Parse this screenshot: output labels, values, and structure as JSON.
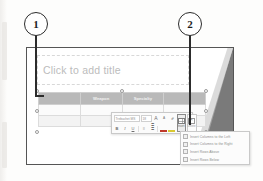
{
  "callouts": [
    {
      "number": "1"
    },
    {
      "number": "2"
    }
  ],
  "slide": {
    "title_placeholder": "Click to add title",
    "table": {
      "headers": [
        "",
        "Weapon",
        "Specialty",
        ""
      ],
      "rows": [
        [
          "",
          "",
          "",
          ""
        ],
        [
          "",
          "",
          "",
          ""
        ]
      ]
    }
  },
  "mini_toolbar": {
    "font_name": "Trebuchet MS",
    "font_size": "18",
    "grow_font_label": "A",
    "shrink_font_label": "A",
    "format_painter_label": "✐",
    "bold_label": "B",
    "italic_label": "I",
    "underline_label": "U",
    "bullets_label": "≡",
    "numbering_label": "≣",
    "font_color_label": "A",
    "highlight_label": "A",
    "insert_button_label": "Insert",
    "delete_button_label": "Delete"
  },
  "insert_menu": {
    "items": [
      {
        "label": "Insert Columns to the Left"
      },
      {
        "label": "Insert Columns to the Right"
      },
      {
        "label": "Insert Rows Above"
      },
      {
        "label": "Insert Rows Below"
      }
    ]
  }
}
